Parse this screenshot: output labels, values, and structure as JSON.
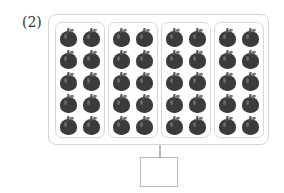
{
  "problem": {
    "label": "(2)"
  },
  "groups": [
    {
      "rows": 5,
      "cols": 2,
      "count": 10
    },
    {
      "rows": 5,
      "cols": 2,
      "count": 10
    },
    {
      "rows": 5,
      "cols": 2,
      "count": 10
    },
    {
      "rows": 5,
      "cols": 2,
      "count": 10
    }
  ],
  "item_icon": "apple-icon",
  "answer_box": {
    "value": ""
  }
}
